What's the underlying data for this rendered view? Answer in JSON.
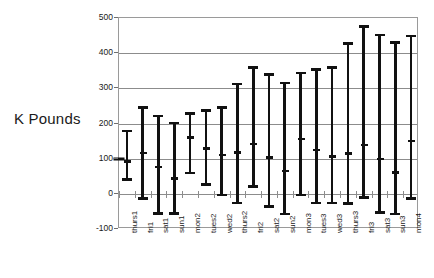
{
  "chart_data": {
    "type": "bar",
    "subtype": "error-bar-range",
    "title": "",
    "xlabel": "",
    "ylabel": "K Pounds",
    "ylim": [
      -100,
      500
    ],
    "ytick_labels": [
      "500",
      "400",
      "300",
      "200",
      "100",
      "0",
      "-100"
    ],
    "ytick_values": [
      500,
      400,
      300,
      200,
      100,
      0,
      -100
    ],
    "grid": true,
    "legend": null,
    "axis_origin_marker": {
      "value": 100,
      "note": "marker on value axis at 100"
    },
    "categories": [
      "thurs1",
      "fri1",
      "sat1",
      "sun1",
      "mon2",
      "tues2",
      "wed2",
      "thurs2",
      "fri2",
      "sat2",
      "sun2",
      "mon3",
      "tues3",
      "wed3",
      "thurs3",
      "fri3",
      "sat3",
      "sun3",
      "mon4"
    ],
    "series": [
      {
        "name": "low",
        "values": [
          42,
          -12,
          -55,
          -55,
          60,
          27,
          -2,
          -25,
          21,
          -36,
          -56,
          -3,
          -25,
          -25,
          -26,
          -10,
          -53,
          -56,
          -13
        ]
      },
      {
        "name": "mid",
        "values": [
          92,
          117,
          77,
          44,
          161,
          130,
          111,
          119,
          143,
          104,
          66,
          157,
          126,
          107,
          116,
          140,
          100,
          62,
          151
        ]
      },
      {
        "name": "high",
        "values": [
          180,
          246,
          222,
          202,
          230,
          237,
          246,
          313,
          360,
          340,
          316,
          345,
          355,
          360,
          428,
          477,
          452,
          432,
          450
        ]
      }
    ],
    "colors": {
      "bar": "#111111",
      "grid": "#8c8c8c",
      "axis": "#9a9a9a",
      "text": "#1a1a1a",
      "background": "#ffffff"
    }
  }
}
